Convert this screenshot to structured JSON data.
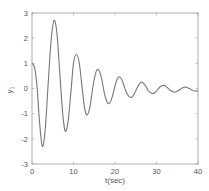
{
  "chart_data": {
    "type": "line",
    "title": "",
    "xlabel": "t(sec)",
    "ylabel": "y1",
    "xlim": [
      0,
      40
    ],
    "ylim": [
      -3,
      3
    ],
    "xticks": [
      0,
      10,
      20,
      30,
      40
    ],
    "yticks": [
      -3,
      -2,
      -1,
      0,
      1,
      2,
      3
    ],
    "grid": false,
    "legend": null,
    "series": [
      {
        "name": "y1",
        "color": "#777777",
        "points": [
          [
            0,
            1.0
          ],
          [
            0.6,
            0.85
          ],
          [
            1.2,
            0.1
          ],
          [
            1.8,
            -1.3
          ],
          [
            2.5,
            -2.3
          ],
          [
            3.2,
            -1.6
          ],
          [
            3.9,
            0.2
          ],
          [
            4.6,
            1.9
          ],
          [
            5.3,
            2.7
          ],
          [
            6.0,
            2.2
          ],
          [
            6.7,
            0.6
          ],
          [
            7.4,
            -1.0
          ],
          [
            8.0,
            -1.7
          ],
          [
            8.7,
            -1.3
          ],
          [
            9.4,
            -0.1
          ],
          [
            10.0,
            1.0
          ],
          [
            10.7,
            1.35
          ],
          [
            11.4,
            1.0
          ],
          [
            12.1,
            0.0
          ],
          [
            12.7,
            -0.8
          ],
          [
            13.3,
            -1.05
          ],
          [
            14.0,
            -0.7
          ],
          [
            14.7,
            0.1
          ],
          [
            15.4,
            0.65
          ],
          [
            16.0,
            0.75
          ],
          [
            16.7,
            0.45
          ],
          [
            17.4,
            -0.15
          ],
          [
            18.0,
            -0.5
          ],
          [
            18.6,
            -0.6
          ],
          [
            19.3,
            -0.35
          ],
          [
            20.0,
            0.1
          ],
          [
            20.6,
            0.4
          ],
          [
            21.2,
            0.45
          ],
          [
            21.9,
            0.25
          ],
          [
            22.6,
            -0.1
          ],
          [
            23.3,
            -0.3
          ],
          [
            24.0,
            -0.35
          ],
          [
            24.7,
            -0.2
          ],
          [
            25.4,
            0.05
          ],
          [
            26.0,
            0.2
          ],
          [
            26.6,
            0.25
          ],
          [
            27.3,
            0.12
          ],
          [
            28.0,
            -0.08
          ],
          [
            28.7,
            -0.18
          ],
          [
            29.3,
            -0.2
          ],
          [
            30.0,
            -0.1
          ],
          [
            30.7,
            0.04
          ],
          [
            31.3,
            0.11
          ],
          [
            31.9,
            0.12
          ],
          [
            32.6,
            0.04
          ],
          [
            33.3,
            -0.07
          ],
          [
            34.0,
            -0.13
          ],
          [
            34.6,
            -0.14
          ],
          [
            35.3,
            -0.08
          ],
          [
            36.0,
            0.0
          ],
          [
            36.6,
            0.05
          ],
          [
            37.2,
            0.05
          ],
          [
            37.9,
            0.0
          ],
          [
            38.6,
            -0.06
          ],
          [
            39.3,
            -0.1
          ],
          [
            40.0,
            -0.1
          ]
        ]
      }
    ]
  },
  "layout": {
    "plot_left": 32,
    "plot_top": 13,
    "plot_right": 198,
    "plot_bottom": 164,
    "axis_color": "#9a9a9a",
    "line_color": "#777777",
    "tick_label_color": "#555555"
  },
  "labels": {
    "xlabel": "t(sec)",
    "ylabel_main": "y",
    "ylabel_sub": "1"
  }
}
